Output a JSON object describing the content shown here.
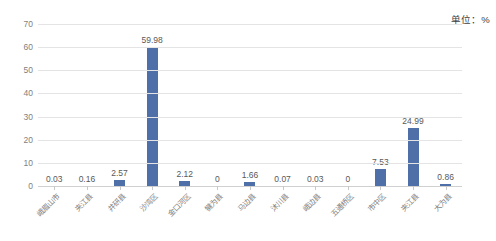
{
  "annotation": {
    "unit_note": "单位：%"
  },
  "style": {
    "bar_color": "#4f6fa8",
    "gridline_color": "#e4e4e4",
    "text_color": "#595959",
    "axis_label_color": "#7f7f7f"
  },
  "chart_data": {
    "type": "bar",
    "title": "",
    "subtitle": "",
    "xlabel": "",
    "ylabel": "",
    "unit": "%",
    "ylim": [
      0,
      70
    ],
    "yticks": [
      0,
      10,
      20,
      30,
      40,
      50,
      60,
      70
    ],
    "grid": true,
    "legend": false,
    "data_labels": true,
    "categories": [
      "峨眉山市",
      "夹江县",
      "井研县",
      "沙湾区",
      "金口河区",
      "犍为县",
      "马边县",
      "沐川县",
      "峨边县",
      "五通桥区",
      "市中区",
      "夹江县",
      "大为县"
    ],
    "values": [
      0.03,
      0.16,
      2.57,
      59.98,
      2.12,
      0,
      1.66,
      0.07,
      0.03,
      0,
      7.53,
      24.99,
      0.86
    ],
    "value_labels": [
      "0.03",
      "0.16",
      "2.57",
      "59.98",
      "2.12",
      "0",
      "1.66",
      "0.07",
      "0.03",
      "0",
      "7.53",
      "24.99",
      "0.86"
    ]
  }
}
